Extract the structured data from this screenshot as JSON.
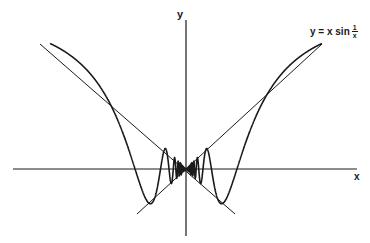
{
  "figure": {
    "x_axis_label": "x",
    "y_axis_label": "y",
    "curve_label": {
      "prefix": "y = x sin",
      "fraction_numerator": "1",
      "fraction_denominator": "x"
    },
    "colors": {
      "ink": "#1a1a1a",
      "background": "#ffffff"
    }
  },
  "chart_data": {
    "type": "line",
    "title": "",
    "xlabel": "x",
    "ylabel": "y",
    "series": [
      {
        "name": "y = x sin(1/x)",
        "function": "x*sin(1/x)",
        "x_range": [
          -0.85,
          0.85
        ]
      },
      {
        "name": "y = x",
        "function": "x",
        "x_range": [
          -0.95,
          0.8
        ],
        "style": "straight line (envelope)"
      },
      {
        "name": "y = -x",
        "function": "-x",
        "x_range": [
          -0.3,
          0.3
        ],
        "style": "straight line (envelope)"
      }
    ],
    "annotations": [
      "y = x sin 1/x"
    ],
    "grid": false
  }
}
